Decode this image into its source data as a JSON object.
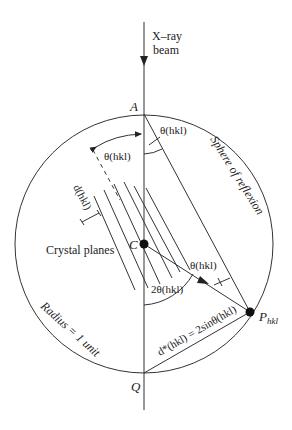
{
  "diagram": {
    "labels": {
      "beam_line1": "X–ray",
      "beam_line2": "beam",
      "point_A": "A",
      "point_C": "C",
      "point_Q": "Q",
      "point_P": "P",
      "point_P_sub": "hkl",
      "theta_top_right": "θ(hkl)",
      "theta_top_left": "θ(hkl)",
      "theta_right": "θ(hkl)",
      "two_theta": "2θ(hkl)",
      "d_spacing": "d(hkl)",
      "crystal_planes": "Crystal planes",
      "sphere": "Sphere of reflexion",
      "radius": "Radius = 1 unit",
      "dstar": "d*(hkl) = 2sinθ(hkl)"
    },
    "geometry": {
      "center": [
        144,
        244
      ],
      "radius": 129,
      "A": [
        144,
        114
      ],
      "Q": [
        144,
        373
      ],
      "P": [
        250,
        312
      ]
    },
    "colors": {
      "line": "#333333",
      "text": "#222222",
      "background": "#ffffff"
    }
  }
}
